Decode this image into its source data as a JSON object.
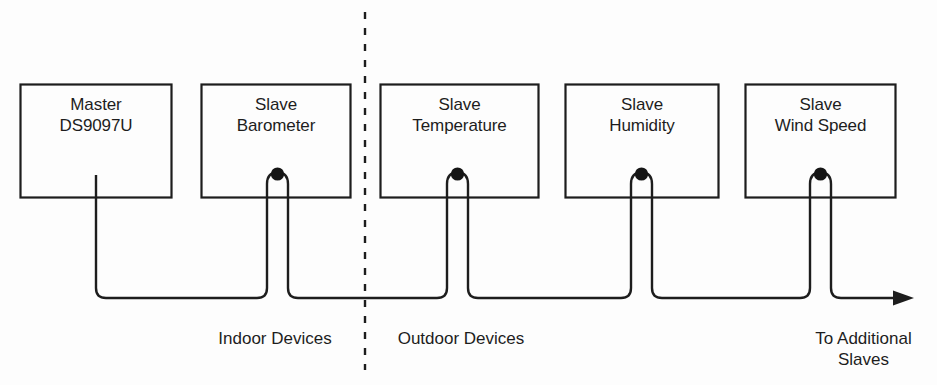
{
  "diagram": {
    "background_color": "#fdfdfd",
    "line_color": "#1d1d1d",
    "text_color": "#1d1d1d",
    "devices": [
      {
        "id": "master",
        "line1": "Master",
        "line2": "DS9097U",
        "label": "Master\nDS9097U",
        "role": "master",
        "zone": "indoor",
        "has_bus_tap": false
      },
      {
        "id": "barometer",
        "line1": "Slave",
        "line2": "Barometer",
        "label": "Slave\nBarometer",
        "role": "slave",
        "zone": "indoor",
        "has_bus_tap": true
      },
      {
        "id": "temperature",
        "line1": "Slave",
        "line2": "Temperature",
        "label": "Slave\nTemperature",
        "role": "slave",
        "zone": "outdoor",
        "has_bus_tap": true
      },
      {
        "id": "humidity",
        "line1": "Slave",
        "line2": "Humidity",
        "label": "Slave\nHumidity",
        "role": "slave",
        "zone": "outdoor",
        "has_bus_tap": true
      },
      {
        "id": "windspeed",
        "line1": "Slave",
        "line2": "Wind Speed",
        "label": "Slave\nWind Speed",
        "role": "slave",
        "zone": "outdoor",
        "has_bus_tap": true
      }
    ],
    "zones": [
      {
        "id": "indoor",
        "label": "Indoor Devices"
      },
      {
        "id": "outdoor",
        "label": "Outdoor Devices"
      }
    ],
    "terminator": {
      "label": "To Additional\nSlaves",
      "line1": "To Additional",
      "line2": "Slaves",
      "arrow": "right-arrowhead"
    },
    "divider": {
      "style": "dashed",
      "orientation": "vertical"
    }
  }
}
